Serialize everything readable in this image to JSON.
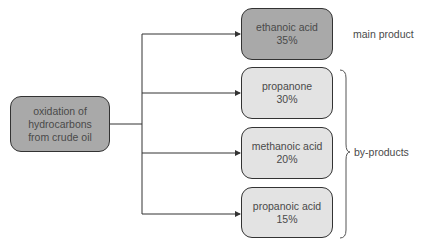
{
  "source": {
    "label": "oxidation of hydrocarbons from crude oil",
    "lines": [
      "oxidation of",
      "hydrocarbons",
      "from crude oil"
    ]
  },
  "products": [
    {
      "name": "ethanoic acid",
      "percent": "35%",
      "category": "main"
    },
    {
      "name": "propanone",
      "percent": "30%",
      "category": "by"
    },
    {
      "name": "methanoic acid",
      "percent": "20%",
      "category": "by"
    },
    {
      "name": "propanoic acid",
      "percent": "15%",
      "category": "by"
    }
  ],
  "labels": {
    "main": "main product",
    "by": "by-products"
  },
  "colors": {
    "dark_fill": "#a9a9a9",
    "light_fill": "#e3e3e3",
    "stroke": "#333333"
  }
}
